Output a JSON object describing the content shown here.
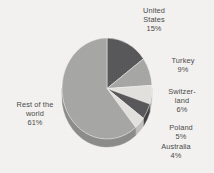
{
  "chart_data": {
    "type": "pie",
    "title": "",
    "subtitle": "",
    "xlabel": "",
    "ylabel": "",
    "legend_position": "callout-labels",
    "grid": false,
    "three_d": true,
    "start_angle_deg": 0,
    "direction": "clockwise",
    "categories": [
      "United States",
      "Turkey",
      "Switzerland",
      "Poland",
      "Australia",
      "Rest of the world"
    ],
    "values": [
      15,
      9,
      6,
      5,
      4,
      61
    ],
    "value_unit": "%",
    "slices": [
      {
        "name": "United States",
        "value": 15,
        "label": "United\nStates\n15%",
        "color": "#58585a",
        "side_color": "#414143"
      },
      {
        "name": "Turkey",
        "value": 9,
        "label": "Turkey\n9%",
        "color": "#a7a7a5",
        "side_color": "#8c8c8a"
      },
      {
        "name": "Switzerland",
        "value": 6,
        "label": "Switzer-\nland\n6%",
        "color": "#e3e2de",
        "side_color": "#c2c1bd"
      },
      {
        "name": "Poland",
        "value": 5,
        "label": "Poland\n5%",
        "color": "#58585a",
        "side_color": "#414143"
      },
      {
        "name": "Australia",
        "value": 4,
        "label": "Australia\n4%",
        "color": "#e3e2de",
        "side_color": "#c2c1bd"
      },
      {
        "name": "Rest of the world",
        "value": 61,
        "label": "Rest of the\nworld\n61%",
        "color": "#a7a7a5",
        "side_color": "#8c8c8a"
      }
    ]
  },
  "labels": {
    "united_states": "United\nStates\n15%",
    "turkey": "Turkey\n9%",
    "switzerland": "Switzer-\nland\n6%",
    "poland": "Poland\n5%",
    "australia": "Australia\n4%",
    "rest_of_world": "Rest of the\nworld\n61%"
  },
  "colors": {
    "background": "#f4f3f1",
    "text": "#4a4a4a",
    "dark_slice": "#58585a",
    "mid_slice": "#a7a7a5",
    "light_slice": "#e3e2de"
  }
}
